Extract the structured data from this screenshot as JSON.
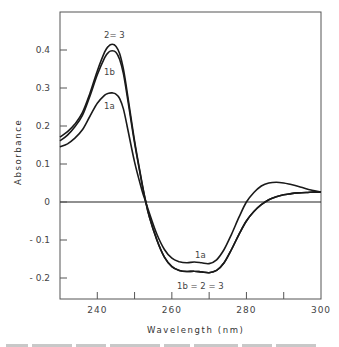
{
  "chart_data": {
    "type": "line",
    "title": "",
    "xlabel": "Wavelength (nm)",
    "ylabel": "Absorbance",
    "xlim": [
      230,
      300
    ],
    "ylim": [
      -0.255,
      0.5
    ],
    "xticks": [
      240,
      250,
      260,
      270,
      280,
      290,
      300
    ],
    "xtick_labels": [
      "240",
      "",
      "260",
      "",
      "280",
      "",
      "300"
    ],
    "yticks": [
      0.4,
      0.3,
      0.2,
      0.1,
      0,
      -0.1,
      -0.2
    ],
    "ytick_labels": [
      "0.4",
      "0.3",
      "0.2",
      "0.1",
      "0",
      "- 0.1",
      "- 0.2"
    ],
    "grid": false,
    "legend": "none (curves labelled inline)",
    "zero_line": true,
    "x": [
      230,
      232,
      234,
      236,
      238,
      240,
      242,
      243,
      244,
      245,
      246,
      247,
      248,
      250,
      252,
      253,
      254,
      256,
      258,
      260,
      262,
      264,
      266,
      268,
      270,
      272,
      274,
      276,
      278,
      280,
      282,
      284,
      286,
      288,
      290,
      292,
      294,
      296,
      298,
      300
    ],
    "series": [
      {
        "name": "2=3",
        "values": [
          0.171,
          0.185,
          0.205,
          0.235,
          0.285,
          0.345,
          0.395,
          0.41,
          0.415,
          0.41,
          0.39,
          0.35,
          0.29,
          0.16,
          0.05,
          0.0,
          -0.04,
          -0.1,
          -0.145,
          -0.17,
          -0.18,
          -0.183,
          -0.182,
          -0.184,
          -0.186,
          -0.18,
          -0.16,
          -0.125,
          -0.085,
          -0.05,
          -0.025,
          -0.007,
          0.006,
          0.014,
          0.019,
          0.022,
          0.024,
          0.025,
          0.026,
          0.026
        ]
      },
      {
        "name": "1b",
        "values": [
          0.161,
          0.176,
          0.198,
          0.228,
          0.278,
          0.335,
          0.38,
          0.394,
          0.398,
          0.394,
          0.375,
          0.338,
          0.28,
          0.155,
          0.048,
          0.0,
          -0.04,
          -0.1,
          -0.145,
          -0.17,
          -0.18,
          -0.183,
          -0.182,
          -0.184,
          -0.186,
          -0.18,
          -0.16,
          -0.125,
          -0.085,
          -0.05,
          -0.025,
          -0.007,
          0.006,
          0.014,
          0.019,
          0.022,
          0.024,
          0.025,
          0.026,
          0.026
        ]
      },
      {
        "name": "1a",
        "values": [
          0.145,
          0.153,
          0.168,
          0.19,
          0.225,
          0.26,
          0.281,
          0.286,
          0.287,
          0.284,
          0.272,
          0.245,
          0.2,
          0.105,
          0.03,
          0.0,
          -0.03,
          -0.085,
          -0.125,
          -0.148,
          -0.157,
          -0.16,
          -0.158,
          -0.16,
          -0.162,
          -0.152,
          -0.125,
          -0.085,
          -0.04,
          0.0,
          0.025,
          0.042,
          0.05,
          0.052,
          0.05,
          0.046,
          0.041,
          0.035,
          0.03,
          0.026
        ]
      }
    ],
    "annotations": [
      {
        "text": "2=3",
        "near": "peak ~245 nm, 0.415"
      },
      {
        "text": "1b",
        "near": "peak ~245 nm, 0.40"
      },
      {
        "text": "1a",
        "near": "peak ~245 nm, 0.29"
      },
      {
        "text": "1a",
        "near": "trough ~268 nm, -0.16"
      },
      {
        "text": "1b = 2 = 3",
        "near": "trough ~268 nm, -0.19"
      }
    ]
  },
  "labels": {
    "y_axis_title": "Absorbance",
    "x_axis_title": "Wavelength (nm)",
    "peak_2_3": "2= 3",
    "peak_1b": "1b",
    "peak_1a": "1a",
    "trough_1a": "1a",
    "trough_1b23": "1b = 2 = 3"
  },
  "style": {
    "line_color": "#1a1a1a",
    "frame_color": "#555555",
    "background": "#ffffff"
  }
}
